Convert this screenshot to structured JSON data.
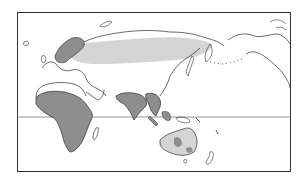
{
  "map": {
    "type": "world-distribution-map",
    "projection": "Pacific-centered",
    "frame": {
      "x": 17,
      "y": 12,
      "width": 274,
      "height": 160
    },
    "equator_y": 118,
    "colors": {
      "coastline": "#2b2b2b",
      "range_light": "#d4d4d4",
      "range_dark": "#8e8e8e",
      "background": "#ffffff",
      "equator": "#777777"
    },
    "regions": [
      {
        "name": "Eurasian northern range",
        "shade": "light"
      },
      {
        "name": "Scandinavia range",
        "shade": "dark"
      },
      {
        "name": "Africa range",
        "shade": "dark"
      },
      {
        "name": "South Asia range",
        "shade": "dark"
      },
      {
        "name": "Southeast Asia range",
        "shade": "dark"
      },
      {
        "name": "Australia range",
        "shade": "dark"
      }
    ]
  }
}
